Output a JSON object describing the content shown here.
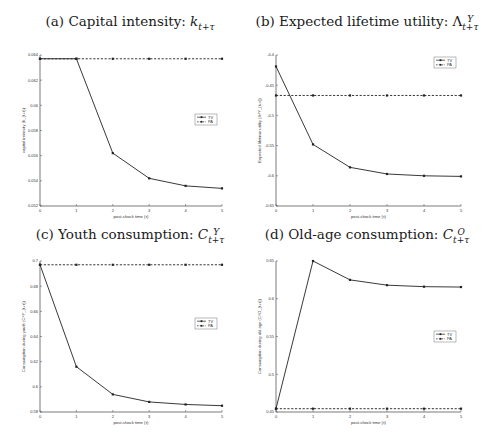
{
  "figure": {
    "legend_labels": [
      "TV",
      "PA"
    ]
  },
  "chart_data": [
    {
      "id": "a",
      "type": "line",
      "title_prefix": "(a) Capital intensity: ",
      "title_math": "k",
      "title_sub": "t+τ",
      "title_sup": "",
      "xlabel": "post-shock time (τ)",
      "ylabel": "capital intensity (k_{t+τ})",
      "x": [
        0,
        1,
        2,
        3,
        4,
        5
      ],
      "xlim": [
        0,
        5
      ],
      "xticks": [
        "0",
        "1",
        "2",
        "3",
        "4",
        "5"
      ],
      "ylim": [
        0.052,
        0.064
      ],
      "yticks": [
        0.052,
        0.054,
        0.056,
        0.058,
        0.06,
        0.062,
        0.064
      ],
      "ytick_labels": [
        "0.052",
        "0.054",
        "0.056",
        "0.058",
        "0.06",
        "0.062",
        "0.064"
      ],
      "legend_position": "center-right",
      "series": [
        {
          "name": "TV",
          "style": "solid",
          "values": [
            0.0637,
            0.0637,
            0.0562,
            0.0542,
            0.0536,
            0.0534
          ]
        },
        {
          "name": "PA",
          "style": "dashed",
          "values": [
            0.0637,
            0.0637,
            0.0637,
            0.0637,
            0.0637,
            0.0637
          ]
        }
      ]
    },
    {
      "id": "b",
      "type": "line",
      "title_prefix": "(b) Expected lifetime utility: ",
      "title_math": "Λ",
      "title_sub": "t+τ",
      "title_sup": "Y",
      "xlabel": "post-shock time (τ)",
      "ylabel": "Expected lifetime utility (Λ^Y_{t+τ})",
      "x": [
        0,
        1,
        2,
        3,
        4,
        5
      ],
      "xlim": [
        0,
        5
      ],
      "xticks": [
        "0",
        "1",
        "2",
        "3",
        "4",
        "5"
      ],
      "ylim": [
        -0.65,
        -0.4
      ],
      "yticks": [
        -0.65,
        -0.6,
        -0.55,
        -0.5,
        -0.45,
        -0.4
      ],
      "ytick_labels": [
        "-0.65",
        "-0.6",
        "-0.55",
        "-0.5",
        "-0.45",
        "-0.4"
      ],
      "legend_position": "top-right",
      "series": [
        {
          "name": "TV",
          "style": "solid",
          "values": [
            -0.419,
            -0.548,
            -0.586,
            -0.597,
            -0.6,
            -0.601
          ]
        },
        {
          "name": "PA",
          "style": "dashed",
          "values": [
            -0.467,
            -0.467,
            -0.467,
            -0.467,
            -0.467,
            -0.467
          ]
        }
      ]
    },
    {
      "id": "c",
      "type": "line",
      "title_prefix": "(c) Youth consumption: ",
      "title_math": "C",
      "title_sub": "t+τ",
      "title_sup": "Y",
      "xlabel": "post-shock time (τ)",
      "ylabel": "Consumption during youth (C^Y_{t+τ})",
      "x": [
        0,
        1,
        2,
        3,
        4,
        5
      ],
      "xlim": [
        0,
        5
      ],
      "xticks": [
        "0",
        "1",
        "2",
        "3",
        "4",
        "5"
      ],
      "ylim": [
        0.58,
        0.7
      ],
      "yticks": [
        0.58,
        0.6,
        0.62,
        0.64,
        0.66,
        0.68,
        0.7
      ],
      "ytick_labels": [
        "0.58",
        "0.6",
        "0.62",
        "0.64",
        "0.66",
        "0.68",
        "0.7"
      ],
      "legend_position": "center-right",
      "series": [
        {
          "name": "TV",
          "style": "solid",
          "values": [
            0.697,
            0.616,
            0.594,
            0.588,
            0.586,
            0.585
          ]
        },
        {
          "name": "PA",
          "style": "dashed",
          "values": [
            0.697,
            0.697,
            0.697,
            0.697,
            0.697,
            0.697
          ]
        }
      ]
    },
    {
      "id": "d",
      "type": "line",
      "title_prefix": "(d) Old-age consumption: ",
      "title_math": "C",
      "title_sub": "t+τ",
      "title_sup": "O",
      "xlabel": "post-shock time (τ)",
      "ylabel": "Consumption during old age (C^O_{t+τ})",
      "x": [
        0,
        1,
        2,
        3,
        4,
        5
      ],
      "xlim": [
        0,
        5
      ],
      "xticks": [
        "0",
        "1",
        "2",
        "3",
        "4",
        "5"
      ],
      "ylim": [
        0.45,
        0.65
      ],
      "yticks": [
        0.45,
        0.5,
        0.55,
        0.6,
        0.65
      ],
      "ytick_labels": [
        "0.45",
        "0.5",
        "0.55",
        "0.6",
        "0.65"
      ],
      "legend_position": "center-right",
      "series": [
        {
          "name": "TV",
          "style": "solid",
          "values": [
            0.4544,
            0.65,
            0.625,
            0.618,
            0.616,
            0.6155
          ]
        },
        {
          "name": "PA",
          "style": "dashed",
          "values": [
            0.4544,
            0.4544,
            0.4544,
            0.4544,
            0.4544,
            0.4544
          ]
        }
      ]
    }
  ]
}
